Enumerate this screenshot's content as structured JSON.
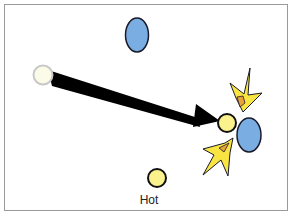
{
  "diagram": {
    "title": "",
    "labels": {
      "hot": "Hot"
    },
    "colors": {
      "background": "#ffffff",
      "frame_border": "#9a9a9a",
      "blue_particle_fill": "#7aaee2",
      "yellow_particle_fill": "#fbf28e",
      "faded_particle_fill": "#fbfbe8",
      "faded_particle_stroke": "#c8c8c8",
      "arrow": "#000000",
      "burst_fill": "#f9e542",
      "burst_inner": "#e8a33a",
      "outline": "#1a1a2a"
    },
    "elements": [
      {
        "id": "blue-particle-top",
        "shape": "ellipse",
        "color": "blue"
      },
      {
        "id": "faded-start-particle",
        "shape": "circle",
        "color": "pale"
      },
      {
        "id": "motion-arrow",
        "shape": "arrow",
        "from": "faded-start-particle",
        "to": "yellow-particle-collision"
      },
      {
        "id": "yellow-particle-collision",
        "shape": "circle",
        "color": "yellow"
      },
      {
        "id": "blue-particle-right",
        "shape": "ellipse",
        "color": "blue"
      },
      {
        "id": "collision-burst-top",
        "shape": "burst"
      },
      {
        "id": "collision-burst-bottom",
        "shape": "burst"
      },
      {
        "id": "yellow-particle-hot",
        "shape": "circle",
        "color": "yellow",
        "label": "Hot"
      }
    ]
  }
}
